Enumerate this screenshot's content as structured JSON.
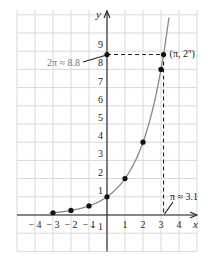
{
  "chart_data": {
    "type": "line",
    "title": "",
    "function": "y = 2^x",
    "xlabel": "x",
    "ylabel": "y",
    "xlim": [
      -5,
      5
    ],
    "ylim": [
      -2,
      11
    ],
    "grid": true,
    "x_ticks": [
      "-4",
      "-3",
      "-2",
      "-1",
      "1",
      "2",
      "3",
      "4"
    ],
    "x_tick_values": [
      -4,
      -3,
      -2,
      -1,
      1,
      2,
      3,
      4
    ],
    "y_ticks": [
      "-1",
      "1",
      "2",
      "3",
      "4",
      "5",
      "6",
      "7",
      "8",
      "9"
    ],
    "y_tick_values": [
      -1,
      1,
      2,
      3,
      4,
      5,
      6,
      7,
      8,
      9
    ],
    "series": [
      {
        "name": "y = 2^x",
        "color": "#888888",
        "points": [
          {
            "x": -3,
            "y": 0.125
          },
          {
            "x": -2,
            "y": 0.25
          },
          {
            "x": -1,
            "y": 0.5
          },
          {
            "x": 0,
            "y": 1
          },
          {
            "x": 1,
            "y": 2
          },
          {
            "x": 2,
            "y": 4
          },
          {
            "x": 3,
            "y": 8
          },
          {
            "x": 3.1416,
            "y": 8.82
          }
        ]
      }
    ],
    "annotations": [
      {
        "text": "(π, 2^π)",
        "label_main": "(π, 2",
        "label_sup": "π",
        "label_close": ")",
        "x": 3.1416,
        "y": 8.82
      },
      {
        "text": "2π ≈ 8.8",
        "x": 0,
        "y": 8.82,
        "color": "#777777"
      },
      {
        "text": "π ≈ 3.1",
        "x": 3.1416,
        "y": 0
      }
    ],
    "colors": {
      "grid": "#d9d9d9",
      "axis": "#222222",
      "curve": "#888888",
      "point": "#111111",
      "dashed": "#222222"
    }
  }
}
